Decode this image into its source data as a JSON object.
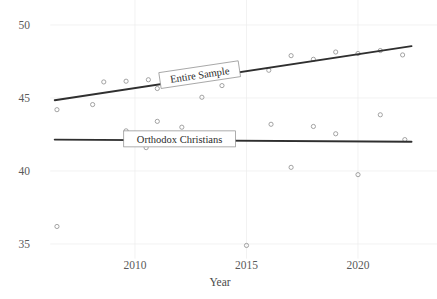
{
  "chart_data": {
    "type": "scatter",
    "title": "",
    "subtitle": "",
    "xlabel": "Year",
    "ylabel": "",
    "xlim": [
      2006.2,
      2022.6
    ],
    "ylim": [
      34.0,
      50.6
    ],
    "xticks": [
      2010,
      2015,
      2020
    ],
    "xtick_labels": [
      "2010",
      "2015",
      "2020"
    ],
    "yticks": [
      35,
      40,
      45,
      50
    ],
    "ytick_labels": [
      "35",
      "40",
      "45",
      "50"
    ],
    "grid": true,
    "legend": "inline-labels",
    "annotations": [
      {
        "text": "Entire Sample",
        "x": 2012.9,
        "y": 46.6,
        "rotation": -8.5
      },
      {
        "text": "Orthodox Christians",
        "x": 2012.0,
        "y": 42.2,
        "rotation": 0
      }
    ],
    "series": [
      {
        "name": "Entire Sample",
        "marker": "open-circle",
        "color": "#8d8d8d",
        "points": [
          {
            "x": 2006.5,
            "y": 44.2
          },
          {
            "x": 2008.1,
            "y": 44.55
          },
          {
            "x": 2008.6,
            "y": 46.1
          },
          {
            "x": 2009.6,
            "y": 46.15
          },
          {
            "x": 2010.6,
            "y": 46.25
          },
          {
            "x": 2011.0,
            "y": 45.65
          },
          {
            "x": 2012.2,
            "y": 46.45
          },
          {
            "x": 2013.0,
            "y": 45.05
          },
          {
            "x": 2013.9,
            "y": 45.85
          },
          {
            "x": 2016.0,
            "y": 46.9
          },
          {
            "x": 2017.0,
            "y": 47.9
          },
          {
            "x": 2018.0,
            "y": 47.65
          },
          {
            "x": 2019.0,
            "y": 48.15
          },
          {
            "x": 2020.0,
            "y": 48.05
          },
          {
            "x": 2021.0,
            "y": 48.25
          },
          {
            "x": 2022.0,
            "y": 47.95
          }
        ],
        "trend": {
          "x0": 2006.4,
          "y0": 44.85,
          "x1": 2022.4,
          "y1": 48.55
        }
      },
      {
        "name": "Orthodox Christians",
        "marker": "open-circle",
        "color": "#8d8d8d",
        "points": [
          {
            "x": 2006.5,
            "y": 36.2
          },
          {
            "x": 2009.6,
            "y": 42.75
          },
          {
            "x": 2010.5,
            "y": 41.6
          },
          {
            "x": 2011.0,
            "y": 43.4
          },
          {
            "x": 2012.1,
            "y": 43.0
          },
          {
            "x": 2015.0,
            "y": 34.9
          },
          {
            "x": 2016.1,
            "y": 43.2
          },
          {
            "x": 2017.0,
            "y": 40.25
          },
          {
            "x": 2018.0,
            "y": 43.05
          },
          {
            "x": 2019.0,
            "y": 42.55
          },
          {
            "x": 2020.0,
            "y": 39.75
          },
          {
            "x": 2021.0,
            "y": 43.85
          },
          {
            "x": 2022.1,
            "y": 42.15
          }
        ],
        "trend": {
          "x0": 2006.4,
          "y0": 42.15,
          "x1": 2022.4,
          "y1": 42.0
        }
      }
    ]
  }
}
